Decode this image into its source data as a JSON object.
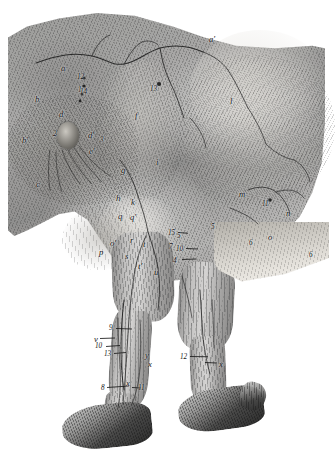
{
  "plate": {
    "title": "Anatomical engraving — equine hind limb, superficial muscles, vessels and nerves",
    "medium": "steel engraving, grayscale",
    "background_color": "#ffffff",
    "ink_color": "#141414",
    "plate_tone": "#9d9a93"
  },
  "figures": [
    {
      "name": "hindquarter",
      "note": "croup, thigh and stifle, skin reflected"
    },
    {
      "name": "left-hind-limb",
      "note": "near limb, gaskin, hock, cannon and hoof"
    },
    {
      "name": "right-hind-limb",
      "note": "off limb, partly behind near limb"
    }
  ],
  "labels": [
    {
      "id": "a",
      "text": "a",
      "x": 61,
      "y": 64
    },
    {
      "id": "aprime",
      "text": "a′",
      "x": 209,
      "y": 35
    },
    {
      "id": "b",
      "text": "b",
      "x": 35,
      "y": 95
    },
    {
      "id": "bprime",
      "text": "b′",
      "x": 22,
      "y": 136
    },
    {
      "id": "c",
      "text": "c",
      "x": 36,
      "y": 180
    },
    {
      "id": "d",
      "text": "d",
      "x": 59,
      "y": 110
    },
    {
      "id": "dprime",
      "text": "d′",
      "x": 88,
      "y": 131
    },
    {
      "id": "eprime",
      "text": "e′",
      "x": 89,
      "y": 147
    },
    {
      "id": "f",
      "text": "f",
      "x": 135,
      "y": 111
    },
    {
      "id": "g",
      "text": "g",
      "x": 121,
      "y": 166
    },
    {
      "id": "h",
      "text": "h",
      "x": 116,
      "y": 194
    },
    {
      "id": "i",
      "text": "i",
      "x": 156,
      "y": 158
    },
    {
      "id": "k",
      "text": "k",
      "x": 131,
      "y": 198
    },
    {
      "id": "l",
      "text": "l",
      "x": 230,
      "y": 97
    },
    {
      "id": "m",
      "text": "m",
      "x": 239,
      "y": 190
    },
    {
      "id": "n",
      "text": "n",
      "x": 286,
      "y": 209
    },
    {
      "id": "o",
      "text": "o",
      "x": 268,
      "y": 233
    },
    {
      "id": "oprime",
      "text": "o′",
      "x": 110,
      "y": 239
    },
    {
      "id": "p",
      "text": "p",
      "x": 99,
      "y": 248
    },
    {
      "id": "q",
      "text": "q",
      "x": 118,
      "y": 212
    },
    {
      "id": "qprime",
      "text": "q′",
      "x": 130,
      "y": 213
    },
    {
      "id": "r",
      "text": "r",
      "x": 130,
      "y": 236
    },
    {
      "id": "s",
      "text": "s",
      "x": 125,
      "y": 252
    },
    {
      "id": "t",
      "text": "t",
      "x": 143,
      "y": 240
    },
    {
      "id": "tprime",
      "text": "t′",
      "x": 138,
      "y": 262
    },
    {
      "id": "u",
      "text": "u",
      "x": 154,
      "y": 268
    },
    {
      "id": "v",
      "text": "v",
      "x": 94,
      "y": 335
    },
    {
      "id": "x",
      "text": "x",
      "x": 148,
      "y": 360
    },
    {
      "id": "x2",
      "text": "x",
      "x": 126,
      "y": 379
    },
    {
      "id": "x3",
      "text": "x",
      "x": 219,
      "y": 360
    },
    {
      "id": "y",
      "text": "y",
      "x": 145,
      "y": 351
    },
    {
      "id": "n1",
      "text": "1",
      "x": 78,
      "y": 87
    },
    {
      "id": "n2",
      "text": "2",
      "x": 53,
      "y": 131
    },
    {
      "id": "n3",
      "text": "3",
      "x": 100,
      "y": 137
    },
    {
      "id": "n4",
      "text": "4",
      "x": 173,
      "y": 258
    },
    {
      "id": "n5",
      "text": "5",
      "x": 177,
      "y": 233
    },
    {
      "id": "n5b",
      "text": "5",
      "x": 211,
      "y": 224
    },
    {
      "id": "n6",
      "text": "6",
      "x": 249,
      "y": 240
    },
    {
      "id": "n6b",
      "text": "6",
      "x": 309,
      "y": 252
    },
    {
      "id": "n7",
      "text": "7",
      "x": 169,
      "y": 244
    },
    {
      "id": "n8",
      "text": "8",
      "x": 101,
      "y": 385
    },
    {
      "id": "n9",
      "text": "9",
      "x": 109,
      "y": 325
    },
    {
      "id": "n10",
      "text": "10",
      "x": 95,
      "y": 343
    },
    {
      "id": "n10b",
      "text": "10",
      "x": 176,
      "y": 246
    },
    {
      "id": "n11",
      "text": "11",
      "x": 138,
      "y": 385
    },
    {
      "id": "n11b",
      "text": "11",
      "x": 262,
      "y": 201
    },
    {
      "id": "n12",
      "text": "12",
      "x": 180,
      "y": 354
    },
    {
      "id": "n12b",
      "text": "12",
      "x": 77,
      "y": 74
    },
    {
      "id": "n13",
      "text": "13",
      "x": 104,
      "y": 351
    },
    {
      "id": "n13b",
      "text": "13",
      "x": 150,
      "y": 86
    },
    {
      "id": "n14",
      "text": "14",
      "x": 80,
      "y": 89
    },
    {
      "id": "n15",
      "text": "15",
      "x": 168,
      "y": 230
    }
  ],
  "leader_lines": [
    {
      "name": "leader-9",
      "x": 116,
      "y": 328,
      "len": 16,
      "angle": 2
    },
    {
      "name": "leader-v",
      "x": 100,
      "y": 338,
      "len": 15,
      "angle": -2
    },
    {
      "name": "leader-10",
      "x": 106,
      "y": 346,
      "len": 14,
      "angle": -4
    },
    {
      "name": "leader-13",
      "x": 114,
      "y": 353,
      "len": 12,
      "angle": -5
    },
    {
      "name": "leader-8",
      "x": 107,
      "y": 387,
      "len": 22,
      "angle": -4
    },
    {
      "name": "leader-11",
      "x": 132,
      "y": 387,
      "len": 9,
      "angle": 3
    },
    {
      "name": "leader-12",
      "x": 190,
      "y": 356,
      "len": 18,
      "angle": 1
    },
    {
      "name": "leader-x3",
      "x": 205,
      "y": 362,
      "len": 12,
      "angle": 2
    },
    {
      "name": "leader-15",
      "x": 178,
      "y": 232,
      "len": 10,
      "angle": 4
    },
    {
      "name": "leader-10b",
      "x": 186,
      "y": 248,
      "len": 12,
      "angle": 2
    },
    {
      "name": "leader-4",
      "x": 182,
      "y": 259,
      "len": 14,
      "angle": -2
    }
  ]
}
